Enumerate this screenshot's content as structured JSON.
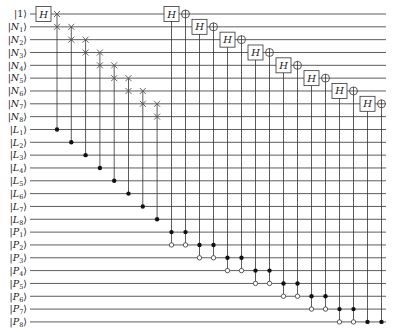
{
  "diagram": {
    "type": "quantum-circuit",
    "wires": [
      {
        "label": "|1⟩",
        "name": "1",
        "sub": ""
      },
      {
        "label": "|N1⟩",
        "name": "N",
        "sub": "1"
      },
      {
        "label": "|N2⟩",
        "name": "N",
        "sub": "2"
      },
      {
        "label": "|N3⟩",
        "name": "N",
        "sub": "3"
      },
      {
        "label": "|N4⟩",
        "name": "N",
        "sub": "4"
      },
      {
        "label": "|N5⟩",
        "name": "N",
        "sub": "5"
      },
      {
        "label": "|N6⟩",
        "name": "N",
        "sub": "6"
      },
      {
        "label": "|N7⟩",
        "name": "N",
        "sub": "7"
      },
      {
        "label": "|N8⟩",
        "name": "N",
        "sub": "8"
      },
      {
        "label": "|L1⟩",
        "name": "L",
        "sub": "1"
      },
      {
        "label": "|L2⟩",
        "name": "L",
        "sub": "2"
      },
      {
        "label": "|L3⟩",
        "name": "L",
        "sub": "3"
      },
      {
        "label": "|L4⟩",
        "name": "L",
        "sub": "4"
      },
      {
        "label": "|L5⟩",
        "name": "L",
        "sub": "5"
      },
      {
        "label": "|L6⟩",
        "name": "L",
        "sub": "6"
      },
      {
        "label": "|L7⟩",
        "name": "L",
        "sub": "7"
      },
      {
        "label": "|L8⟩",
        "name": "L",
        "sub": "8"
      },
      {
        "label": "|P1⟩",
        "name": "P",
        "sub": "1"
      },
      {
        "label": "|P2⟩",
        "name": "P",
        "sub": "2"
      },
      {
        "label": "|P3⟩",
        "name": "P",
        "sub": "3"
      },
      {
        "label": "|P4⟩",
        "name": "P",
        "sub": "4"
      },
      {
        "label": "|P5⟩",
        "name": "P",
        "sub": "5"
      },
      {
        "label": "|P6⟩",
        "name": "P",
        "sub": "6"
      },
      {
        "label": "|P7⟩",
        "name": "P",
        "sub": "7"
      },
      {
        "label": "|P8⟩",
        "name": "P",
        "sub": "8"
      }
    ],
    "gates": {
      "initial_hadamard": {
        "wire": 0,
        "label": "H"
      },
      "controlled_swaps": [
        {
          "a": 0,
          "b": 1,
          "control": 9
        },
        {
          "a": 1,
          "b": 2,
          "control": 10
        },
        {
          "a": 2,
          "b": 3,
          "control": 11
        },
        {
          "a": 3,
          "b": 4,
          "control": 12
        },
        {
          "a": 4,
          "b": 5,
          "control": 13
        },
        {
          "a": 5,
          "b": 6,
          "control": 14
        },
        {
          "a": 6,
          "b": 7,
          "control": 15
        },
        {
          "a": 7,
          "b": 8,
          "control": 16
        }
      ],
      "controlled_h_and_not": [
        {
          "target": 0,
          "filled": [
            17
          ],
          "open": [
            18
          ]
        },
        {
          "target": 1,
          "filled": [
            18
          ],
          "open": [
            19
          ]
        },
        {
          "target": 2,
          "filled": [
            19
          ],
          "open": [
            20
          ]
        },
        {
          "target": 3,
          "filled": [
            20
          ],
          "open": [
            21
          ]
        },
        {
          "target": 4,
          "filled": [
            21
          ],
          "open": [
            22
          ]
        },
        {
          "target": 5,
          "filled": [
            22
          ],
          "open": [
            23
          ]
        },
        {
          "target": 6,
          "filled": [
            23
          ],
          "open": [
            24
          ]
        },
        {
          "target": 7,
          "filled": [
            24
          ],
          "open": []
        }
      ],
      "h_label": "H"
    }
  },
  "layout": {
    "wire_y0": 14,
    "wire_dy": 12.83,
    "wire_x0": 30,
    "wire_x1": 386,
    "label_x": 27,
    "swap_x0": 57,
    "swap_dx": 14.3,
    "pair_x0": 171.5,
    "pair_dx": 28,
    "pair_gap": 14
  }
}
